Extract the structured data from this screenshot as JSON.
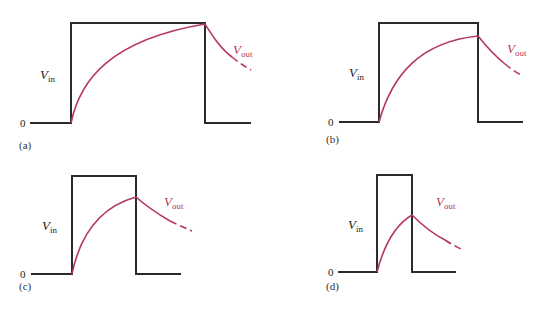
{
  "figure": {
    "colors": {
      "vin": "#2b2b2b",
      "vout": "#b5385a",
      "background": "#ffffff"
    },
    "panels": [
      {
        "id": "a",
        "label": "(a)",
        "zero": "0",
        "vin_label": "V",
        "vin_sub": "in",
        "vout_label": "V",
        "vout_sub": "out",
        "pulse_width": "long (≈5τ)",
        "vout_peak": "reaches full amplitude"
      },
      {
        "id": "b",
        "label": "(b)",
        "zero": "0",
        "vin_label": "V",
        "vin_sub": "in",
        "vout_label": "V",
        "vout_sub": "out",
        "pulse_width": "medium",
        "vout_peak": "near full amplitude"
      },
      {
        "id": "c",
        "label": "(c)",
        "zero": "0",
        "vin_label": "V",
        "vin_sub": "in",
        "vout_label": "V",
        "vout_sub": "out",
        "pulse_width": "short",
        "vout_peak": "about 80% of amplitude"
      },
      {
        "id": "d",
        "label": "(d)",
        "zero": "0",
        "vin_label": "V",
        "vin_sub": "in",
        "vout_label": "V",
        "vout_sub": "out",
        "pulse_width": "very short",
        "vout_peak": "about 60% of amplitude"
      }
    ]
  }
}
